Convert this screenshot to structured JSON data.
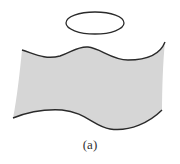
{
  "figure": {
    "caption": "(a)",
    "colors": {
      "sheet_fill": "#d6d6d6",
      "stroke": "#2a2a2a",
      "background": "#ffffff"
    },
    "elements": [
      {
        "name": "loop-ellipse",
        "type": "ellipse",
        "cx": 95,
        "cy": 23,
        "rx": 29,
        "ry": 11
      },
      {
        "name": "wavy-sheet",
        "type": "surface",
        "description": "gray shaded wavy sheet with dark top and bottom edges"
      }
    ]
  }
}
